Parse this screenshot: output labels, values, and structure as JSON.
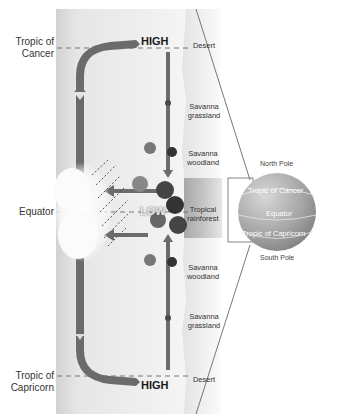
{
  "diagram": {
    "latitudes": {
      "tropic_of_cancer": "Tropic of\nCancer",
      "equator": "Equator",
      "tropic_of_capricorn": "Tropic of\nCapricorn"
    },
    "pressure": {
      "north_high": "HIGH",
      "equator_low": "LOW",
      "south_high": "HIGH"
    },
    "biomes": [
      {
        "id": "desert-north",
        "label": "Desert"
      },
      {
        "id": "savanna-grassland-north",
        "label": "Savanna\ngrassland"
      },
      {
        "id": "savanna-woodland-north",
        "label": "Savanna\nwoodland"
      },
      {
        "id": "tropical-rainforest",
        "label": "Tropical\nrainforest"
      },
      {
        "id": "savanna-woodland-south",
        "label": "Savanna\nwoodland"
      },
      {
        "id": "savanna-grassland-south",
        "label": "Savanna\ngrassland"
      },
      {
        "id": "desert-south",
        "label": "Desert"
      }
    ],
    "globe": {
      "north_pole": "North Pole",
      "tropic_of_cancer": "Tropic of Cancer",
      "equator": "Equator",
      "tropic_of_capricorn": "Tropic of Capricorn",
      "south_pole": "South Pole"
    },
    "colors": {
      "arrow": "#6b6b6b",
      "panel_light": "#ececec",
      "panel_edge": "#cfcfcf",
      "rainforest_band": "#bdbdbd",
      "globe": "#a9a9a9",
      "text": "#333333"
    }
  }
}
